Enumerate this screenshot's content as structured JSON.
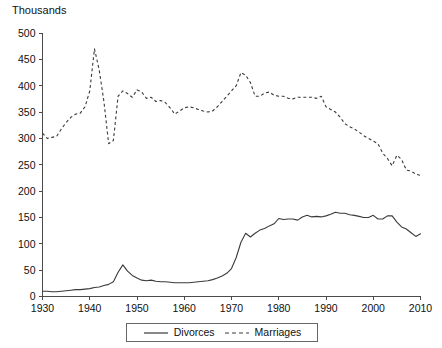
{
  "chart_data": {
    "type": "line",
    "title": "",
    "subtitle": "",
    "xlabel": "",
    "ylabel": "Thousands",
    "unit_label": "Thousands",
    "xlim": [
      1930,
      2010
    ],
    "ylim": [
      0,
      500
    ],
    "x_ticks": [
      1930,
      1940,
      1950,
      1960,
      1970,
      1980,
      1990,
      2000,
      2010
    ],
    "y_ticks": [
      0,
      50,
      100,
      150,
      200,
      250,
      300,
      350,
      400,
      450,
      500
    ],
    "grid": false,
    "legend_position": "bottom-center",
    "x": [
      1930,
      1931,
      1932,
      1933,
      1934,
      1935,
      1936,
      1937,
      1938,
      1939,
      1940,
      1941,
      1942,
      1943,
      1944,
      1945,
      1946,
      1947,
      1948,
      1949,
      1950,
      1951,
      1952,
      1953,
      1954,
      1955,
      1956,
      1957,
      1958,
      1959,
      1960,
      1961,
      1962,
      1963,
      1964,
      1965,
      1966,
      1967,
      1968,
      1969,
      1970,
      1971,
      1972,
      1973,
      1974,
      1975,
      1976,
      1977,
      1978,
      1979,
      1980,
      1981,
      1982,
      1983,
      1984,
      1985,
      1986,
      1987,
      1988,
      1989,
      1990,
      1991,
      1992,
      1993,
      1994,
      1995,
      1996,
      1997,
      1998,
      1999,
      2000,
      2001,
      2002,
      2003,
      2004,
      2005,
      2006,
      2007,
      2008,
      2009,
      2010
    ],
    "series": [
      {
        "name": "Divorces",
        "style": "solid",
        "color": "#3a3a3a",
        "values": [
          10,
          10,
          9,
          9,
          10,
          11,
          12,
          13,
          13,
          14,
          15,
          17,
          18,
          21,
          23,
          28,
          46,
          60,
          48,
          40,
          35,
          31,
          30,
          31,
          29,
          28,
          28,
          27,
          26,
          26,
          26,
          26,
          27,
          28,
          29,
          30,
          32,
          35,
          39,
          44,
          53,
          74,
          103,
          120,
          113,
          120,
          126,
          129,
          134,
          138,
          148,
          146,
          147,
          147,
          145,
          151,
          154,
          151,
          152,
          151,
          153,
          156,
          160,
          158,
          158,
          155,
          154,
          152,
          150,
          150,
          154,
          147,
          147,
          153,
          153,
          141,
          132,
          128,
          121,
          114,
          119
        ]
      },
      {
        "name": "Marriages",
        "style": "dashed",
        "color": "#3a3a3a",
        "values": [
          310,
          300,
          302,
          304,
          318,
          330,
          340,
          346,
          348,
          360,
          390,
          470,
          430,
          370,
          290,
          296,
          380,
          390,
          385,
          378,
          392,
          388,
          376,
          378,
          370,
          372,
          368,
          358,
          346,
          352,
          358,
          360,
          358,
          355,
          352,
          350,
          352,
          360,
          370,
          380,
          390,
          400,
          425,
          420,
          406,
          380,
          380,
          386,
          388,
          382,
          380,
          380,
          376,
          375,
          378,
          378,
          378,
          378,
          376,
          380,
          360,
          355,
          350,
          340,
          328,
          322,
          318,
          312,
          305,
          300,
          295,
          290,
          272,
          262,
          248,
          268,
          260,
          240,
          238,
          232,
          230
        ]
      }
    ]
  },
  "legend": {
    "entries": [
      {
        "label": "Divorces",
        "style": "solid"
      },
      {
        "label": "Marriages",
        "style": "dashed"
      }
    ]
  }
}
